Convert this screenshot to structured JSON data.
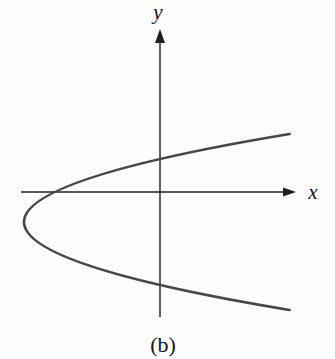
{
  "figure": {
    "background": "#fdfdfd",
    "axis_color": "#1f1f1f",
    "curve_color": "#474747",
    "label_color": "#141414",
    "x_axis_label": "x",
    "y_axis_label": "y",
    "caption": "(b)"
  },
  "chart_data": {
    "type": "line",
    "title": "",
    "xlabel": "x",
    "ylabel": "y",
    "caption": "(b)",
    "grid": false,
    "ticks": "none",
    "axes": {
      "x_axis_px": {
        "y": 192,
        "x_start": 21,
        "x_end": 296,
        "arrow_len": 13,
        "arrow_half_width": 4.5
      },
      "y_axis_px": {
        "x": 160,
        "y_start": 29,
        "y_end": 317,
        "arrow_len": 14,
        "arrow_half_width": 5
      }
    },
    "series": [
      {
        "name": "parabola",
        "equation_screen": "x = vertex.x + a * (y - vertex.y)^2 (pixel coords)",
        "vertex_px": {
          "x": 24,
          "y": 222
        },
        "a_px": 0.0343,
        "y_extent_px": [
          134,
          310
        ],
        "x_axis_crossing_px": {
          "x": 55,
          "y": 192
        },
        "y_axis_crossings_px": [
          {
            "x": 160,
            "y": 159
          },
          {
            "x": 160,
            "y": 285
          }
        ],
        "stroke_width": 2.7
      }
    ],
    "axis_stroke_width": 1.4
  }
}
